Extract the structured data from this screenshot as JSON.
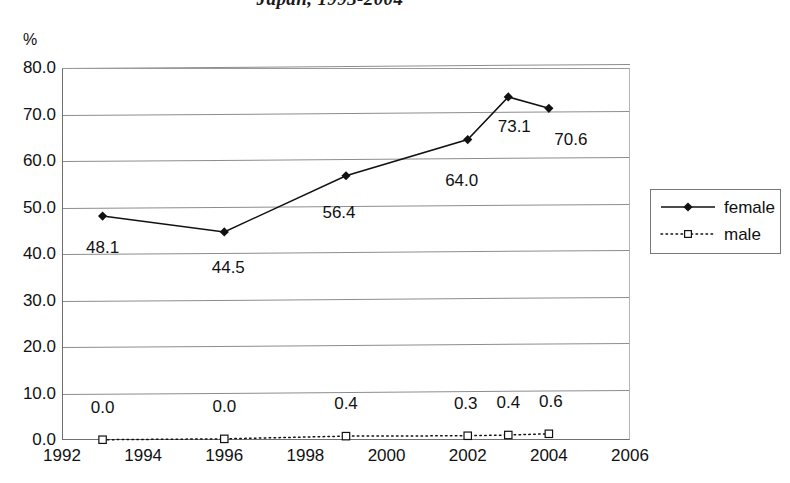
{
  "chart_data": {
    "type": "line",
    "title": "Japan, 1993-2004",
    "xlabel": "",
    "ylabel": "%",
    "x": [
      1993,
      1996,
      1999,
      2002,
      2003,
      2004
    ],
    "xlim": [
      1992,
      2006
    ],
    "ylim": [
      0.0,
      80.0
    ],
    "xticks": [
      "1992",
      "1994",
      "1996",
      "1998",
      "2000",
      "2002",
      "2004",
      "2006"
    ],
    "xtick_values": [
      1992,
      1994,
      1996,
      1998,
      2000,
      2002,
      2004,
      2006
    ],
    "yticks": [
      "0.0",
      "10.0",
      "20.0",
      "30.0",
      "40.0",
      "50.0",
      "60.0",
      "70.0",
      "80.0"
    ],
    "ytick_values": [
      0.0,
      10.0,
      20.0,
      30.0,
      40.0,
      50.0,
      60.0,
      70.0,
      80.0
    ],
    "grid": "horizontal",
    "legend_position": "right",
    "series": [
      {
        "name": "female",
        "values": [
          48.1,
          44.5,
          56.4,
          64.0,
          73.1,
          70.6
        ],
        "labels": [
          "48.1",
          "44.5",
          "56.4",
          "64.0",
          "73.1",
          "70.6"
        ],
        "line_style": "solid",
        "marker": "filled-diamond",
        "color": "#111111"
      },
      {
        "name": "male",
        "values": [
          0.0,
          0.0,
          0.4,
          0.3,
          0.4,
          0.6
        ],
        "labels": [
          "0.0",
          "0.0",
          "0.4",
          "0.3",
          "0.4",
          "0.6"
        ],
        "line_style": "dotted",
        "marker": "open-square",
        "color": "#111111"
      }
    ]
  },
  "legend": {
    "entries": [
      {
        "label": "female"
      },
      {
        "label": "male"
      }
    ]
  }
}
